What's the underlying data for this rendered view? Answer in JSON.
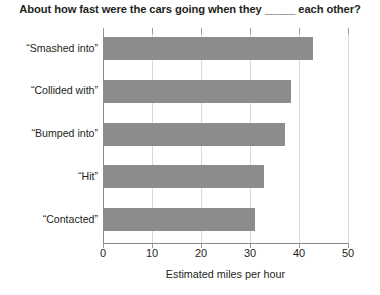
{
  "chart_data": {
    "type": "bar",
    "orientation": "horizontal",
    "title": "About how fast were the cars going when they _____ each other?",
    "categories": [
      "“Smashed into”",
      "“Collided with”",
      "“Bumped into”",
      "“Hit”",
      "“Contacted”"
    ],
    "values": [
      42.8,
      38.4,
      37.1,
      32.9,
      31.0
    ],
    "xlabel": "Estimated miles per hour",
    "ylabel": "",
    "xlim": [
      0,
      50
    ],
    "xticks": [
      0,
      10,
      20,
      30,
      40,
      50
    ],
    "xtick_labels": [
      "0",
      "10",
      "20",
      "30",
      "40",
      "50"
    ],
    "grid": "vertical",
    "legend": "none",
    "bar_color": "#8c8c8c",
    "gridline_color": "#d9d9d9",
    "axis_color": "#8a8a8a",
    "text_color": "#231f20"
  }
}
